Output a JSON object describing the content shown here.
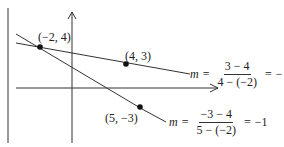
{
  "points": [
    {
      "label": "(−2, 4)",
      "x": -2,
      "y": 4
    },
    {
      "label": "(4, 3)",
      "x": 4,
      "y": 3
    },
    {
      "label": "(5, −3)",
      "x": 5,
      "y": -3
    }
  ],
  "equations": [
    {
      "variable": "m",
      "equals": "=",
      "numerator": "3 − 4",
      "denominator": "4 − (−2)",
      "result_sign": "−",
      "result_num": "1",
      "result_den": "6"
    },
    {
      "variable": "m",
      "equals": "=",
      "numerator": "−3 − 4",
      "denominator": "5 − (−2)",
      "result": "−1"
    }
  ],
  "colors": {
    "ink": "#222222",
    "background": "#ffffff"
  }
}
